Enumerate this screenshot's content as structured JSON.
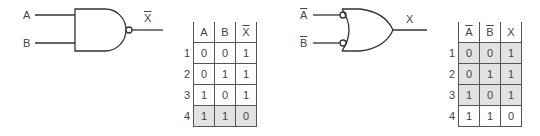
{
  "left_gate": {
    "type": "NAND",
    "inputs": [
      "A",
      "B"
    ],
    "output": "X",
    "output_overline": true
  },
  "left_table": {
    "headers": [
      {
        "text": "A",
        "overline": false
      },
      {
        "text": "B",
        "overline": false
      },
      {
        "text": "X",
        "overline": true
      }
    ],
    "rows": [
      {
        "n": "1",
        "cells": [
          "0",
          "0",
          "1"
        ],
        "shaded": false
      },
      {
        "n": "2",
        "cells": [
          "0",
          "1",
          "1"
        ],
        "shaded": false
      },
      {
        "n": "3",
        "cells": [
          "1",
          "0",
          "1"
        ],
        "shaded": false
      },
      {
        "n": "4",
        "cells": [
          "1",
          "1",
          "0"
        ],
        "shaded": true
      }
    ]
  },
  "right_gate": {
    "type": "OR with inverted inputs",
    "inputs": [
      "A",
      "B"
    ],
    "inputs_overline": true,
    "output": "X"
  },
  "right_table": {
    "headers": [
      {
        "text": "A",
        "overline": true
      },
      {
        "text": "B",
        "overline": true
      },
      {
        "text": "X",
        "overline": false
      }
    ],
    "rows": [
      {
        "n": "1",
        "cells": [
          "0",
          "0",
          "1"
        ],
        "shaded": true
      },
      {
        "n": "2",
        "cells": [
          "0",
          "1",
          "1"
        ],
        "shaded": true
      },
      {
        "n": "3",
        "cells": [
          "1",
          "0",
          "1"
        ],
        "shaded": true
      },
      {
        "n": "4",
        "cells": [
          "1",
          "1",
          "0"
        ],
        "shaded": false
      }
    ]
  },
  "colors": {
    "line": "#333333",
    "shade": "#e2e2e2"
  }
}
